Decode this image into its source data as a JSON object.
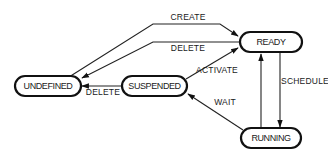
{
  "diagram": {
    "type": "state-transition",
    "colors": {
      "stroke": "#111111",
      "text": "#1a1a1a",
      "background": "#ffffff"
    },
    "nodes": {
      "ready": {
        "label": "READY"
      },
      "running": {
        "label": "RUNNING"
      },
      "suspended": {
        "label": "SUSPENDED"
      },
      "undefined": {
        "label": "UNDEFINED"
      }
    },
    "edges": {
      "create": {
        "label": "CREATE",
        "from": "UNDEFINED",
        "to": "READY"
      },
      "delete_ready": {
        "label": "DELETE",
        "from": "READY",
        "to": "UNDEFINED"
      },
      "activate": {
        "label": "ACTIVATE",
        "from": "SUSPENDED",
        "to": "READY"
      },
      "delete_suspended": {
        "label": "DELETE",
        "from": "SUSPENDED",
        "to": "UNDEFINED"
      },
      "schedule": {
        "label": "SCHEDULE",
        "from": "READY",
        "to": "RUNNING"
      },
      "preempt": {
        "label": "",
        "from": "RUNNING",
        "to": "READY"
      },
      "wait": {
        "label": "WAIT",
        "from": "RUNNING",
        "to": "SUSPENDED"
      }
    }
  }
}
